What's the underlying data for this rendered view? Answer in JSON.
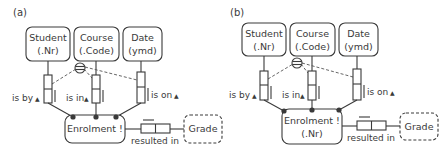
{
  "panels": [
    {
      "label": "(a)",
      "entities": [
        {
          "name": "Student",
          "ref": "(.Nr)"
        },
        {
          "name": "Course",
          "ref": "(.Code)"
        },
        {
          "name": "Date",
          "ref": "(ymd)"
        }
      ],
      "objectified": {
        "name": "Enrolment !",
        "ref": ""
      },
      "roles": [
        {
          "reading": "is by"
        },
        {
          "reading": "is in"
        },
        {
          "reading": "is on"
        }
      ],
      "value_type": {
        "name": "Grade"
      },
      "fact": {
        "reading": "resulted in"
      }
    },
    {
      "label": "(b)",
      "entities": [
        {
          "name": "Student",
          "ref": "(.Nr)"
        },
        {
          "name": "Course",
          "ref": "(.Code)"
        },
        {
          "name": "Date",
          "ref": "(ymd)"
        }
      ],
      "objectified": {
        "name": "Enrolment !",
        "ref": "(.Nr)"
      },
      "roles": [
        {
          "reading": "is by"
        },
        {
          "reading": "is in"
        },
        {
          "reading": "is on"
        }
      ],
      "value_type": {
        "name": "Grade"
      },
      "fact": {
        "reading": "resulted in"
      }
    }
  ],
  "icons": {
    "direction_arrow": "▲",
    "uniqueness_constraint": "circled-bar"
  },
  "colors": {
    "stroke": "#3a3a3a",
    "background": "#ffffff"
  }
}
